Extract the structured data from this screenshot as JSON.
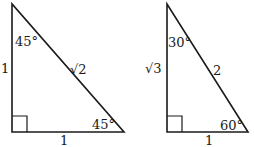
{
  "triangles": [
    {
      "name": "45-45-90",
      "vertical_side": "1",
      "hypotenuse": "√2",
      "base": "1",
      "top_angle": "45°",
      "bottom_angle": "45°"
    },
    {
      "name": "30-60-90",
      "vertical_side": "√3",
      "hypotenuse": "2",
      "base": "1",
      "top_angle": "30°",
      "bottom_angle": "60°"
    }
  ],
  "colors": {
    "stroke": "#1a1a1a",
    "background": "#ffffff"
  }
}
